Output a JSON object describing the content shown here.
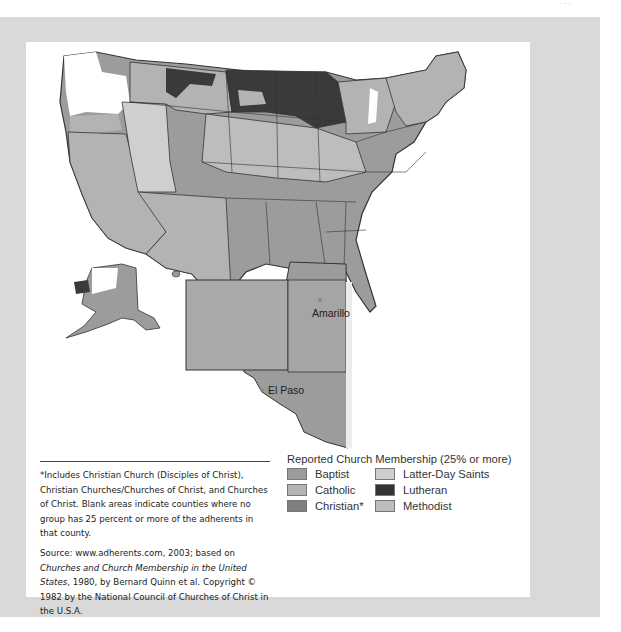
{
  "page": {
    "corner_mark": "· · ·"
  },
  "map": {
    "title": "Reported Church Membership (25% or more)",
    "cities": [
      {
        "name": "Amarillo"
      },
      {
        "name": "El Paso"
      }
    ],
    "colors": {
      "baptist": "#9c9c9c",
      "catholic": "#b3b3b3",
      "christian": "#7f7f7f",
      "latter_day_saints": "#cfcfcf",
      "lutheran": "#3a3a3a",
      "methodist": "#bdbdbd",
      "blank": "#ffffff",
      "border": "#333333"
    }
  },
  "legend": {
    "title": "Reported Church Membership (25% or more)",
    "items": [
      {
        "label": "Baptist",
        "color": "#9c9c9c"
      },
      {
        "label": "Latter-Day Saints",
        "color": "#cfcfcf"
      },
      {
        "label": "Catholic",
        "color": "#b3b3b3"
      },
      {
        "label": "Lutheran",
        "color": "#333333"
      },
      {
        "label": "Christian*",
        "color": "#7f7f7f"
      },
      {
        "label": "Methodist",
        "color": "#bdbdbd"
      }
    ]
  },
  "footnote": {
    "note": "*Includes Christian Church (Disciples of Christ), Christian Churches/Churches of Christ, and Churches of Christ. Blank areas indicate counties where no group has 25 percent or more of the adherents in that county.",
    "source_prefix": "Source: www.adherents.com, 2003; based on ",
    "source_title": "Churches and Church Membership in the United States",
    "source_suffix": ", 1980, by Bernard Quinn et al. Copyright © 1982 by the National Council of Churches of Christ in the U.S.A."
  }
}
